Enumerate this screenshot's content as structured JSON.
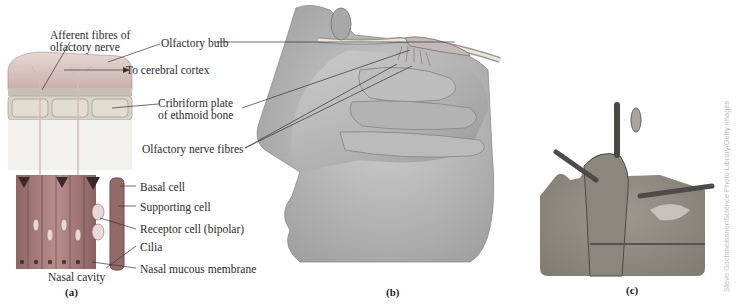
{
  "figure": {
    "panels": [
      {
        "id": "a",
        "caption": "(a)"
      },
      {
        "id": "b",
        "caption": "(b)"
      },
      {
        "id": "c",
        "caption": "(c)"
      }
    ],
    "labels": {
      "afferent_fibres_line1": "Afferent fibres of",
      "afferent_fibres_line2": "olfactory nerve",
      "olfactory_bulb": "Olfactory bulb",
      "to_cerebral_cortex": "To cerebral cortex",
      "cribriform_line1": "Cribriform plate",
      "cribriform_line2": "of ethmoid bone",
      "olfactory_nerve_fibres": "Olfactory nerve fibres",
      "basal_cell": "Basal cell",
      "supporting_cell": "Supporting cell",
      "receptor_cell": "Receptor cell (bipolar)",
      "cilia": "Cilia",
      "nasal_mucous_membrane": "Nasal mucous membrane",
      "nasal_cavity": "Nasal cavity"
    },
    "credit": "Steve Gschmeissner/Science Photo Library/Getty Images",
    "colors": {
      "tissue_pink": "#b98f8f",
      "tissue_dark": "#7a5a5a",
      "bone_tan": "#d8d2c2",
      "gray_drawing": "#a9a9a9",
      "micrograph": "#8a8a82"
    }
  }
}
